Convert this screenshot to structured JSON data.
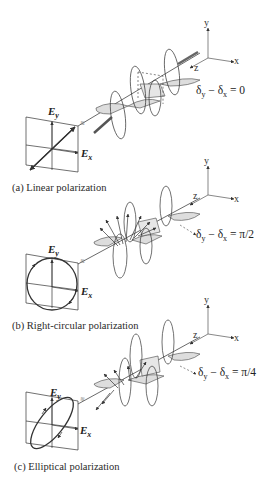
{
  "panels": [
    {
      "id": "a",
      "caption": "(a) Linear polarization",
      "equation": {
        "lhs_1": "δ",
        "sub_1": "y",
        "minus": " − ",
        "lhs_2": "δ",
        "sub_2": "x",
        "rhs": " = 0"
      },
      "axes": {
        "x": "x",
        "y": "y",
        "z": "z"
      },
      "field_labels": {
        "ey_base": "E",
        "ey_sub": "y",
        "ex_base": "E",
        "ex_sub": "x"
      },
      "propagation_symbol": "eye-icon"
    },
    {
      "id": "b",
      "caption": "(b) Right-circular polarization",
      "equation": {
        "lhs_1": "δ",
        "sub_1": "y",
        "minus": " − ",
        "lhs_2": "δ",
        "sub_2": "x",
        "rhs": " = π/2"
      },
      "axes": {
        "x": "x",
        "y": "y",
        "z": "z"
      },
      "field_labels": {
        "ey_base": "E",
        "ey_sub": "y",
        "ex_base": "E",
        "ex_sub": "x"
      },
      "propagation_symbol": "eye-icon"
    },
    {
      "id": "c",
      "caption": "(c) Elliptical polarization",
      "equation": {
        "lhs_1": "δ",
        "sub_1": "y",
        "minus": " − ",
        "lhs_2": "δ",
        "sub_2": "x",
        "rhs": " = π/4"
      },
      "axes": {
        "x": "x",
        "y": "y",
        "z": "z"
      },
      "field_labels": {
        "ey_base": "E",
        "ey_sub": "y",
        "ex_base": "E",
        "ex_sub": "x"
      },
      "propagation_symbol": "eye-icon"
    }
  ],
  "colors": {
    "line": "#333333",
    "fill": "#d9d9d9",
    "background": "#ffffff"
  }
}
